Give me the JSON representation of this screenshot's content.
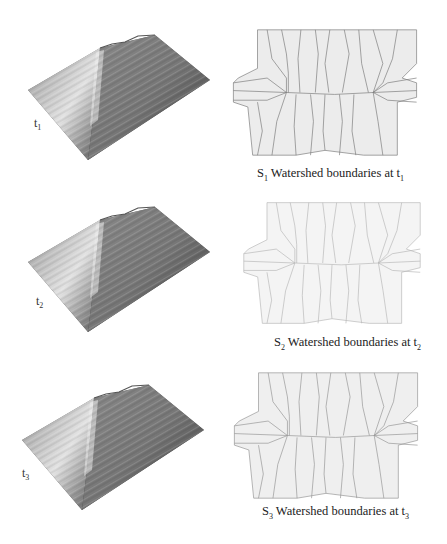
{
  "figure": {
    "panels": [
      {
        "time_label": {
          "base": "t",
          "sub": "1"
        },
        "caption": {
          "s": "S",
          "s_sub": "1",
          "text": " Watershed boundaries at t",
          "t_sub": "1"
        }
      },
      {
        "time_label": {
          "base": "t",
          "sub": "2"
        },
        "caption": {
          "s": "S",
          "s_sub": "2",
          "text": " Watershed boundaries at t",
          "t_sub": "2"
        }
      },
      {
        "time_label": {
          "base": "t",
          "sub": "3"
        },
        "caption": {
          "s": "S",
          "s_sub": "3",
          "text": " Watershed boundaries at t",
          "t_sub": "3"
        }
      }
    ],
    "colors": {
      "background": "#ffffff",
      "region_fill": "#ececec",
      "boundary_line": "#7a7a7a",
      "surface_light": "#d8d8d8",
      "surface_dark": "#4a4a4a"
    }
  }
}
